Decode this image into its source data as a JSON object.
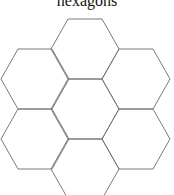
{
  "title": "hexagons",
  "diagram": {
    "stroke_color": "#7a7a7a",
    "background": "#ffffff",
    "hex_radius": 34,
    "hexagons": [
      {
        "id": "top",
        "cx": 85,
        "cy": 49
      },
      {
        "id": "upper-left",
        "cx": 35,
        "cy": 79
      },
      {
        "id": "upper-right",
        "cx": 136,
        "cy": 79
      },
      {
        "id": "center",
        "cx": 85,
        "cy": 109
      },
      {
        "id": "lower-left",
        "cx": 35,
        "cy": 139
      },
      {
        "id": "lower-right",
        "cx": 136,
        "cy": 139
      },
      {
        "id": "bottom",
        "cx": 85,
        "cy": 169
      }
    ]
  }
}
